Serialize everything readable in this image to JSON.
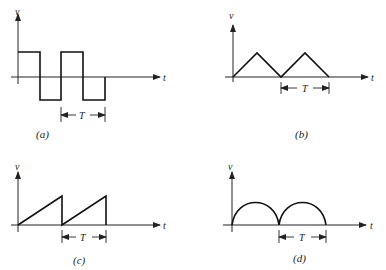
{
  "figure": {
    "panels": [
      {
        "id": "a",
        "caption": "(a)",
        "waveform": "square",
        "y_label": "v",
        "x_label": "t",
        "period_label": "T"
      },
      {
        "id": "b",
        "caption": "(b)",
        "waveform": "triangle",
        "y_label": "v",
        "x_label": "t",
        "period_label": "T"
      },
      {
        "id": "c",
        "caption": "(c)",
        "waveform": "sawtooth",
        "y_label": "v",
        "x_label": "t",
        "period_label": "T"
      },
      {
        "id": "d",
        "caption": "(d)",
        "waveform": "full-wave rectified sine",
        "y_label": "v",
        "x_label": "t",
        "period_label": "T"
      }
    ]
  }
}
